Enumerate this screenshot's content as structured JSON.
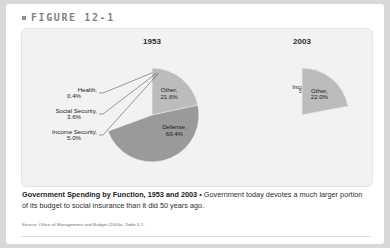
{
  "figure": {
    "bullet_icon": "square-bullet-icon",
    "label": "FIGURE 12-1"
  },
  "caption": {
    "title": "Government Spending by Function, 1953 and 2003",
    "separator": "•",
    "body": "Government today devotes a much larger portion of its budget to social insurance than it did 50 years ago.",
    "source": "Source: Office of Management and Budget (2004a, Table 3.1."
  },
  "colors": {
    "panel_bg": "#f2f2f2",
    "page_bg": "#ffffff",
    "header_text": "#7e838b",
    "defense": "#9a9a9a",
    "health": "#cfcfcf",
    "social_security": "#a8a8a8",
    "income_security": "#8e8e8e",
    "other": "#bcbcbc"
  },
  "chart_data": [
    {
      "type": "pie",
      "title": "1953",
      "center": [
        145,
        110
      ],
      "radius": 47,
      "start_angle": -90,
      "labels_inside": [
        "Defense",
        "Other"
      ],
      "categories": [
        "Defense",
        "Health",
        "Social Security",
        "Income Security",
        "Other"
      ],
      "values": [
        69.4,
        0.4,
        3.6,
        5.0,
        21.6
      ],
      "slices": [
        {
          "name": "Defense",
          "value": 69.4,
          "label": "Defense,",
          "value_label": "69.4%",
          "color": "#9a9a9a",
          "placement": "inside"
        },
        {
          "name": "Health",
          "value": 0.4,
          "label": "Health,",
          "value_label": "0.4%",
          "color": "#cfcfcf",
          "placement": "outside"
        },
        {
          "name": "Social Security",
          "value": 3.6,
          "label": "Social Security,",
          "value_label": "3.6%",
          "color": "#a8a8a8",
          "placement": "outside"
        },
        {
          "name": "Income Security",
          "value": 5.0,
          "label": "Income Security,",
          "value_label": "5.0%",
          "color": "#8e8e8e",
          "placement": "outside"
        },
        {
          "name": "Other",
          "value": 21.6,
          "label": "Other,",
          "value_label": "21.6%",
          "color": "#bcbcbc",
          "placement": "inside"
        }
      ]
    },
    {
      "type": "pie",
      "title": "2003",
      "center": [
        295,
        110
      ],
      "radius": 47,
      "start_angle": -90,
      "labels_inside": [
        "Defense",
        "Health",
        "Social Security",
        "Income Security",
        "Other"
      ],
      "categories": [
        "Defense",
        "Health",
        "Social Security",
        "Income Security",
        "Other"
      ],
      "values": [
        18.8,
        21.7,
        22.0,
        15.5,
        22.0
      ],
      "slices": [
        {
          "name": "Defense",
          "value": 18.8,
          "label": "Defense,",
          "value_label": "18.8%",
          "color": "#9a9a9a",
          "placement": "inside"
        },
        {
          "name": "Health",
          "value": 21.7,
          "label": "Health,",
          "value_label": "21.7%",
          "color": "#cfcfcf",
          "placement": "inside"
        },
        {
          "name": "Social Security",
          "value": 22.0,
          "label": "Social Security,",
          "value_label": "22.0%",
          "color": "#a8a8a8",
          "placement": "inside"
        },
        {
          "name": "Income Security",
          "value": 15.5,
          "label": "Income Security,",
          "value_label": "15.5%",
          "color": "#8e8e8e",
          "placement": "inside"
        },
        {
          "name": "Other",
          "value": 22.0,
          "label": "Other,",
          "value_label": "22.0%",
          "color": "#bcbcbc",
          "placement": "inside"
        }
      ]
    }
  ]
}
